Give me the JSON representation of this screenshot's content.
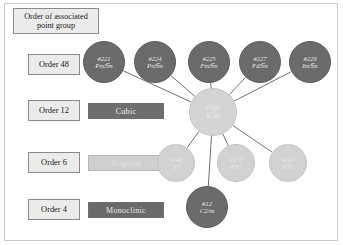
{
  "legend": {
    "title": "Order of associated point group",
    "orders": [
      {
        "label": "Order 48"
      },
      {
        "label": "Order 12"
      },
      {
        "label": "Order 6"
      },
      {
        "label": "Order 4"
      }
    ],
    "systems": [
      {
        "label": "Cubic",
        "color": "#6e6e6e"
      },
      {
        "label": "Trigonal",
        "color": "#cfcfcf"
      },
      {
        "label": "Monoclinic",
        "color": "#6a6a6a"
      }
    ]
  },
  "graph": {
    "hub": {
      "id": "#166",
      "symbol": "R3̅m",
      "cx": 213,
      "cy": 112,
      "r": 24,
      "style": "hub"
    },
    "nodes": [
      {
        "id": "#221",
        "symbol": "Pm3̅m",
        "cx": 104,
        "cy": 62,
        "r": 21,
        "style": "dark"
      },
      {
        "id": "#224",
        "symbol": "Pn3̅m",
        "cx": 155,
        "cy": 62,
        "r": 21,
        "style": "dark"
      },
      {
        "id": "#225",
        "symbol": "Fm3̅m",
        "cx": 209,
        "cy": 62,
        "r": 21,
        "style": "dark"
      },
      {
        "id": "#227",
        "symbol": "Fd3̅m",
        "cx": 260,
        "cy": 62,
        "r": 21,
        "style": "dark"
      },
      {
        "id": "#229",
        "symbol": "Im3̅m",
        "cx": 310,
        "cy": 62,
        "r": 21,
        "style": "dark"
      },
      {
        "id": "#148",
        "symbol": "R3̅",
        "cx": 176,
        "cy": 163,
        "r": 19,
        "style": "light"
      },
      {
        "id": "#155",
        "symbol": "R32",
        "cx": 236,
        "cy": 163,
        "r": 19,
        "style": "light"
      },
      {
        "id": "#166",
        "symbol": "R3̅m",
        "cx": 288,
        "cy": 163,
        "r": 19,
        "style": "light"
      },
      {
        "id": "#12",
        "symbol": "C2/m",
        "cx": 207,
        "cy": 207,
        "r": 21,
        "style": "dark"
      }
    ],
    "edges": [
      {
        "from": "#221",
        "to": "#166"
      },
      {
        "from": "#224",
        "to": "#166"
      },
      {
        "from": "#225",
        "to": "#166"
      },
      {
        "from": "#227",
        "to": "#166"
      },
      {
        "from": "#229",
        "to": "#166"
      },
      {
        "from": "#166",
        "to": "#148"
      },
      {
        "from": "#166",
        "to": "#155"
      },
      {
        "from": "#166",
        "to": "#16x"
      },
      {
        "from": "#166",
        "to": "#12"
      }
    ],
    "edge_color": "#6f6f6f"
  }
}
